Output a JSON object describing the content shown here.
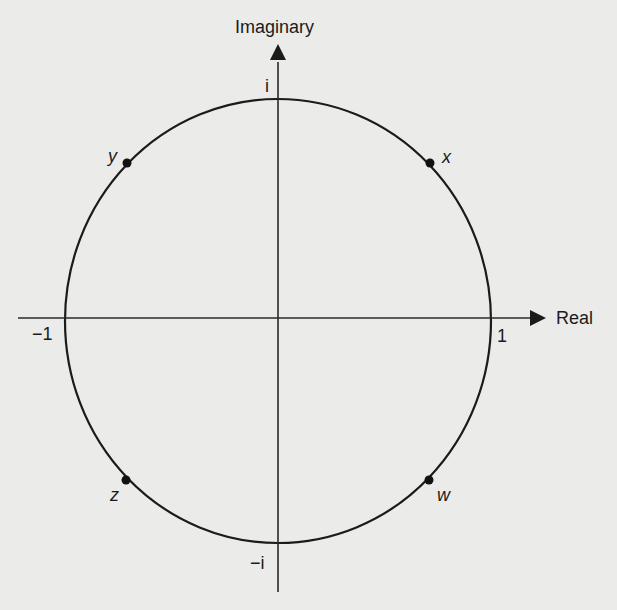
{
  "diagram": {
    "type": "complex-plane-unit-circle",
    "axes": {
      "vertical": {
        "label": "Imaginary"
      },
      "horizontal": {
        "label": "Real"
      }
    },
    "ticks": {
      "top": "i",
      "bottom": "−i",
      "left": "−1",
      "right": "1"
    },
    "points": [
      {
        "name": "x",
        "label": "x",
        "quadrant": "I",
        "angle_deg": 45
      },
      {
        "name": "y",
        "label": "y",
        "quadrant": "II",
        "angle_deg": 135
      },
      {
        "name": "z",
        "label": "z",
        "quadrant": "III",
        "angle_deg": 225
      },
      {
        "name": "w",
        "label": "w",
        "quadrant": "IV",
        "angle_deg": 315
      }
    ],
    "colors": {
      "background": "#ebebea",
      "ink": "#1b1b1b"
    }
  }
}
